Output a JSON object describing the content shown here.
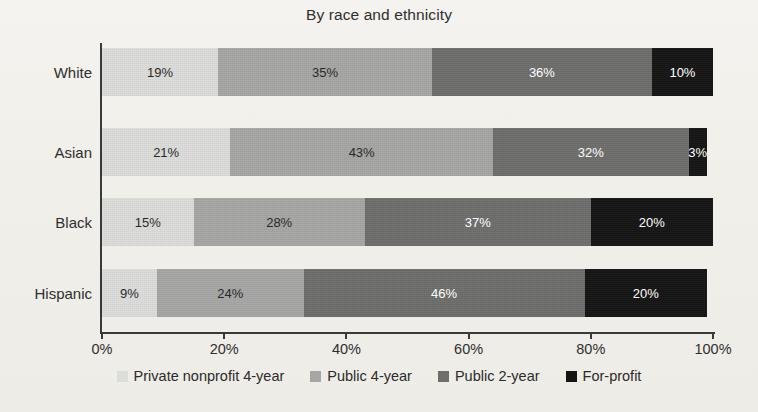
{
  "chart_data": {
    "type": "bar",
    "subtype": "horizontal-stacked-100",
    "title": "By race and ethnicity",
    "xlabel": "",
    "ylabel": "",
    "xlim": [
      0,
      100
    ],
    "xticks": [
      "0%",
      "20%",
      "40%",
      "60%",
      "80%",
      "100%"
    ],
    "xtick_values": [
      0,
      20,
      40,
      60,
      80,
      100
    ],
    "grid": false,
    "legend_position": "bottom",
    "categories": [
      "White",
      "Asian",
      "Black",
      "Hispanic"
    ],
    "series": [
      {
        "name": "Private nonprofit 4-year",
        "color": "#dcdcda",
        "label_color": "#2a2a2a",
        "values": [
          19,
          21,
          15,
          9
        ],
        "labels": [
          "19%",
          "21%",
          "15%",
          "9%"
        ]
      },
      {
        "name": "Public 4-year",
        "color": "#a6a6a4",
        "label_color": "#2a2a2a",
        "values": [
          35,
          43,
          28,
          24
        ],
        "labels": [
          "35%",
          "43%",
          "28%",
          "24%"
        ]
      },
      {
        "name": "Public 2-year",
        "color": "#6e6e6d",
        "label_color": "#ffffff",
        "values": [
          36,
          32,
          37,
          46
        ],
        "labels": [
          "36%",
          "32%",
          "37%",
          "46%"
        ]
      },
      {
        "name": "For-profit",
        "color": "#141414",
        "label_color": "#ffffff",
        "values": [
          10,
          3,
          20,
          20
        ],
        "labels": [
          "10%",
          "3%",
          "20%",
          "20%"
        ]
      }
    ]
  },
  "axis": {
    "line_color": "#3a3a3a"
  },
  "background": {
    "page_color": "#f3f1ec"
  }
}
